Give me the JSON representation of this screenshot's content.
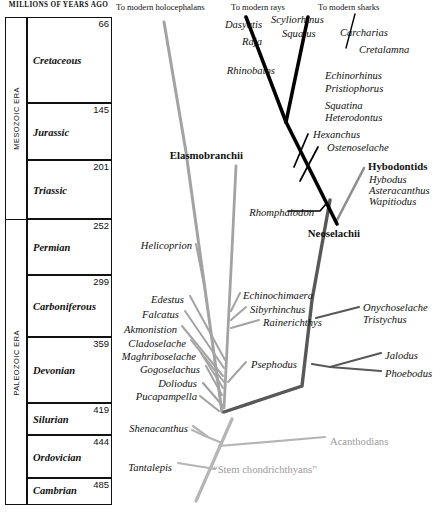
{
  "timescale": {
    "header": "MILLIONS OF YEARS AGO",
    "eras": [
      {
        "name": "MESOZOIC ERA",
        "top": 17,
        "bottom": 219
      },
      {
        "name": "PALEOZOIC ERA",
        "top": 219,
        "bottom": 505
      }
    ],
    "rows": [
      {
        "name": "Cretaceous",
        "age": "66",
        "top": 17,
        "bottom": 103
      },
      {
        "name": "Jurassic",
        "age": "145",
        "top": 103,
        "bottom": 160
      },
      {
        "name": "Triassic",
        "age": "201",
        "top": 160,
        "bottom": 219
      },
      {
        "name": "Permian",
        "age": "252",
        "top": 219,
        "bottom": 275
      },
      {
        "name": "Carboniferous",
        "age": "299",
        "top": 275,
        "bottom": 337
      },
      {
        "name": "Devonian",
        "age": "359",
        "top": 337,
        "bottom": 403
      },
      {
        "name": "Silurian",
        "age": "419",
        "top": 403,
        "bottom": 435
      },
      {
        "name": "Ordovician",
        "age": "444",
        "top": 435,
        "bottom": 478
      },
      {
        "name": "Cambrian",
        "age": "485",
        "top": 478,
        "bottom": 505
      }
    ]
  },
  "tree": {
    "headers": [
      {
        "text": "To modern holocephalans",
        "x": 116,
        "y": 3,
        "align": "left"
      },
      {
        "text": "To modern rays",
        "x": 231,
        "y": 3,
        "align": "left"
      },
      {
        "text": "To modern sharks",
        "x": 318,
        "y": 3,
        "align": "left"
      }
    ],
    "clades": [
      {
        "text": "Elasmobranchii",
        "x": 243,
        "y": 150,
        "align": "right"
      },
      {
        "text": "Neoselachii",
        "x": 360,
        "y": 228,
        "align": "right"
      },
      {
        "text": "Hybodontids",
        "x": 368,
        "y": 161,
        "align": "left"
      }
    ],
    "taxa": [
      {
        "text": "Dasyatis",
        "x": 262,
        "y": 20,
        "align": "right"
      },
      {
        "text": "Raja",
        "x": 262,
        "y": 37,
        "align": "right"
      },
      {
        "text": "Scyliorhinus",
        "x": 271,
        "y": 15,
        "align": "left"
      },
      {
        "text": "Squalus",
        "x": 282,
        "y": 29,
        "align": "left"
      },
      {
        "text": "Carcharias",
        "x": 340,
        "y": 28,
        "align": "left"
      },
      {
        "text": "Cretalamna",
        "x": 359,
        "y": 45,
        "align": "left"
      },
      {
        "text": "Rhinobatos",
        "x": 275,
        "y": 66,
        "align": "right"
      },
      {
        "text": "Echinorhinus",
        "x": 325,
        "y": 71,
        "align": "left"
      },
      {
        "text": "Pristiophorus",
        "x": 325,
        "y": 84,
        "align": "left"
      },
      {
        "text": "Squatina",
        "x": 325,
        "y": 101,
        "align": "left"
      },
      {
        "text": "Heterodontus",
        "x": 325,
        "y": 113,
        "align": "left"
      },
      {
        "text": "Hexanchus",
        "x": 313,
        "y": 130,
        "align": "left"
      },
      {
        "text": "Ostenoselache",
        "x": 327,
        "y": 143,
        "align": "left"
      },
      {
        "text": "Hybodus",
        "x": 369,
        "y": 175,
        "align": "left"
      },
      {
        "text": "Asteracanthus",
        "x": 369,
        "y": 186,
        "align": "left"
      },
      {
        "text": "Wapitiodus",
        "x": 369,
        "y": 197,
        "align": "left"
      },
      {
        "text": "Rhomphaiodon",
        "x": 314,
        "y": 208,
        "align": "right"
      },
      {
        "text": "Helicoprion",
        "x": 192,
        "y": 241,
        "align": "right"
      },
      {
        "text": "Edestus",
        "x": 184,
        "y": 295,
        "align": "right"
      },
      {
        "text": "Falcatus",
        "x": 179,
        "y": 310,
        "align": "right"
      },
      {
        "text": "Akmonistion",
        "x": 177,
        "y": 325,
        "align": "right"
      },
      {
        "text": "Cladoselache",
        "x": 186,
        "y": 339,
        "align": "right"
      },
      {
        "text": "Maghriboselache",
        "x": 196,
        "y": 352,
        "align": "right"
      },
      {
        "text": "Gogoselachus",
        "x": 200,
        "y": 365,
        "align": "right"
      },
      {
        "text": "Doliodus",
        "x": 197,
        "y": 379,
        "align": "right"
      },
      {
        "text": "Pucapampella",
        "x": 197,
        "y": 392,
        "align": "right"
      },
      {
        "text": "Echinochimaera",
        "x": 243,
        "y": 291,
        "align": "left"
      },
      {
        "text": "Sibyrhinchus",
        "x": 250,
        "y": 305,
        "align": "left"
      },
      {
        "text": "Rainerichthys",
        "x": 263,
        "y": 318,
        "align": "left"
      },
      {
        "text": "Psephodus",
        "x": 251,
        "y": 360,
        "align": "left"
      },
      {
        "text": "Onychoselache",
        "x": 363,
        "y": 303,
        "align": "left"
      },
      {
        "text": "Tristychus",
        "x": 363,
        "y": 315,
        "align": "left"
      },
      {
        "text": "Jalodus",
        "x": 385,
        "y": 351,
        "align": "left"
      },
      {
        "text": "Phoebodus",
        "x": 385,
        "y": 369,
        "align": "left"
      },
      {
        "text": "Shenacanthus",
        "x": 188,
        "y": 424,
        "align": "right"
      },
      {
        "text": "Tantalepis",
        "x": 172,
        "y": 463,
        "align": "right"
      }
    ],
    "stem_labels": [
      {
        "text": "Acanthodians",
        "x": 330,
        "y": 437,
        "align": "left"
      },
      {
        "text": "“Stem chondrichthyans”",
        "x": 213,
        "y": 465,
        "align": "left"
      }
    ]
  },
  "colors": {
    "elasmobranch_black": "#000000",
    "hybodont_gray": "#8e8e8e",
    "holocephalan_gray": "#a3a3a3",
    "stem_gray": "#b5b5b5",
    "neoselachii_trunk": "#585858",
    "frame": "#111111"
  }
}
